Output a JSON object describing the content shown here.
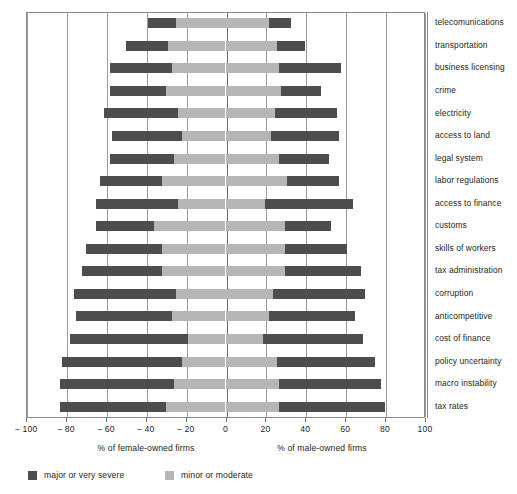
{
  "chart_data": {
    "type": "bar",
    "orientation": "horizontal",
    "style": "diverging-stacked-bar",
    "title": "",
    "xlabel_left": "% of female-owned firms",
    "xlabel_right": "% of male-owned firms",
    "ylabel": "",
    "xlim": [
      -100,
      100
    ],
    "xticks": [
      -100,
      -80,
      -60,
      -40,
      -20,
      0,
      20,
      40,
      60,
      80,
      100
    ],
    "xticklabels": [
      "− 100",
      "− 80",
      "− 60",
      "− 40",
      "− 20",
      "0",
      "20",
      "40",
      "60",
      "80",
      "100"
    ],
    "grid": true,
    "grid_axis": "x",
    "legend_position": "bottom-left",
    "legend": [
      {
        "name": "major or very severe",
        "color": "#4d4d4d"
      },
      {
        "name": "minor or moderate",
        "color": "#b6b6b6"
      }
    ],
    "categories": [
      "telecomunications",
      "transportation",
      "business licensing",
      "crime",
      "electricity",
      "access to land",
      "legal system",
      "labor regulations",
      "access to finance",
      "customs",
      "skills of workers",
      "tax administration",
      "corruption",
      "anticompetitive",
      "cost of finance",
      "policy uncertainty",
      "macro instability",
      "tax rates"
    ],
    "series": [
      {
        "name": "female major or very severe",
        "side": "left",
        "color": "#4d4d4d",
        "from": [
          -39,
          -50,
          -58,
          -58,
          -61,
          -57,
          -58,
          -63,
          -65,
          -65,
          -70,
          -72,
          -76,
          -75,
          -78,
          -82,
          -83,
          -83
        ],
        "to": [
          -25,
          -29,
          -27,
          -30,
          -24,
          -22,
          -26,
          -32,
          -24,
          -36,
          -32,
          -32,
          -25,
          -27,
          -19,
          -22,
          -26,
          -30
        ]
      },
      {
        "name": "female minor or moderate",
        "side": "left",
        "color": "#b6b6b6",
        "from": [
          -25,
          -29,
          -27,
          -30,
          -24,
          -22,
          -26,
          -32,
          -24,
          -36,
          -32,
          -32,
          -25,
          -27,
          -19,
          -22,
          -26,
          -30
        ],
        "to": [
          0,
          0,
          0,
          0,
          0,
          0,
          0,
          0,
          0,
          0,
          0,
          0,
          0,
          0,
          0,
          0,
          0,
          0
        ]
      },
      {
        "name": "male minor or moderate",
        "side": "right",
        "color": "#b6b6b6",
        "from": [
          0,
          0,
          0,
          0,
          0,
          0,
          0,
          0,
          0,
          0,
          0,
          0,
          0,
          0,
          0,
          0,
          0,
          0
        ],
        "to": [
          22,
          26,
          27,
          28,
          25,
          23,
          27,
          31,
          20,
          30,
          30,
          30,
          24,
          22,
          19,
          26,
          27,
          27
        ]
      },
      {
        "name": "male major or very severe",
        "side": "right",
        "color": "#4d4d4d",
        "from": [
          22,
          26,
          27,
          28,
          25,
          23,
          27,
          31,
          20,
          30,
          30,
          30,
          24,
          22,
          19,
          26,
          27,
          27
        ],
        "to": [
          33,
          40,
          58,
          48,
          56,
          57,
          52,
          57,
          64,
          53,
          61,
          68,
          70,
          65,
          69,
          75,
          78,
          80
        ]
      }
    ]
  }
}
